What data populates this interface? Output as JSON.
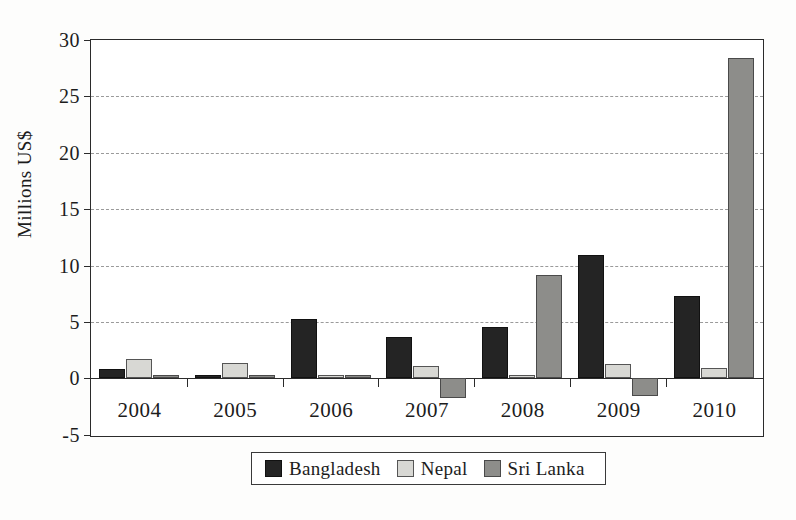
{
  "chart_data": {
    "type": "bar",
    "title": "",
    "subtitle": "",
    "xlabel": "",
    "ylabel": "Millions US$",
    "categories": [
      "2004",
      "2005",
      "2006",
      "2007",
      "2008",
      "2009",
      "2010"
    ],
    "series": [
      {
        "name": "Bangladesh",
        "color": "#242424",
        "values": [
          0.8,
          0.2,
          5.3,
          3.7,
          4.6,
          10.9,
          7.3
        ]
      },
      {
        "name": "Nepal",
        "color": "#d8d8d4",
        "values": [
          1.7,
          1.4,
          0.3,
          1.1,
          0.25,
          1.3,
          0.9
        ]
      },
      {
        "name": "Sri Lanka",
        "color": "#8d8d8a",
        "values": [
          0.2,
          0.15,
          0.3,
          -1.7,
          9.2,
          -1.6,
          28.4
        ]
      }
    ],
    "ylim": [
      -5,
      30
    ],
    "ytick_labels": [
      "30",
      "25",
      "20",
      "15",
      "10",
      "5",
      "0",
      "-5"
    ],
    "ytick_values": [
      30,
      25,
      20,
      15,
      10,
      5,
      0,
      -5
    ],
    "grid": true,
    "grid_style": "dashed-horizontal",
    "legend_position": "bottom-center",
    "legend_entries": [
      "Bangladesh",
      "Nepal",
      "Sri Lanka"
    ],
    "zero_line": true
  }
}
